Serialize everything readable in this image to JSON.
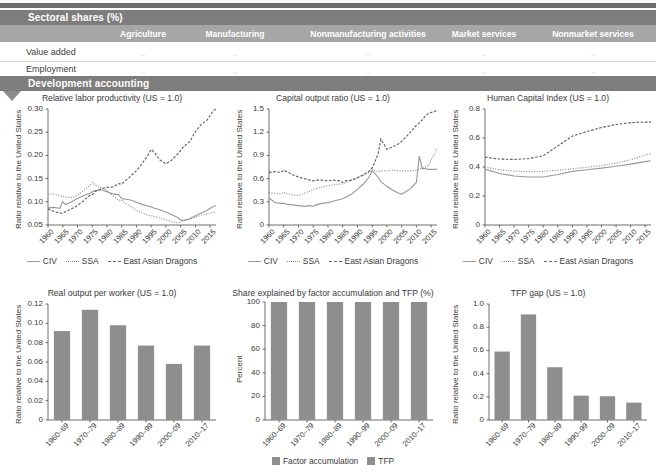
{
  "sectoral_panel": {
    "title": "Sectoral shares (%)",
    "columns": [
      "Agriculture",
      "Manufacturing",
      "Nonmanufacturing activities",
      "Market services",
      "Nonmarket services"
    ],
    "rows": [
      {
        "label": "Value added",
        "values": [
          "..",
          "..",
          "..",
          "..",
          ".."
        ]
      },
      {
        "label": "Employment",
        "values": [
          "..",
          "..",
          "..",
          "..",
          ".."
        ]
      }
    ]
  },
  "development_panel": {
    "title": "Development accounting"
  },
  "colors": {
    "band": "#7d7d7d",
    "column_header": "#a6a6a6",
    "bar": "#8e8e8e",
    "civ": "#9a9a9a",
    "ssa": "#8a8a8a",
    "dragons": "#5f5f5f"
  },
  "legends": {
    "lines": [
      "CIV",
      "SSA",
      "East Asian Dragons"
    ],
    "bars": [
      "Factor accumulation",
      "TFP"
    ]
  },
  "chart_data": [
    {
      "id": "relative-labor-productivity",
      "type": "line",
      "title": "Relative labor productivity (US = 1.0)",
      "ylabel": "Ratio relative to the United States",
      "xlabel": "",
      "ylim": [
        0.05,
        0.3
      ],
      "yticks": [
        "0.05",
        "0.10",
        "0.15",
        "0.20",
        "0.25",
        "0.30"
      ],
      "xlim": [
        1960,
        2017
      ],
      "xticks": [
        "1960",
        "1965",
        "1970",
        "1975",
        "1980",
        "1985",
        "1990",
        "1995",
        "2000",
        "2005",
        "2010",
        "2015"
      ],
      "grid": false,
      "legend_position": "bottom",
      "x": [
        1960,
        1962,
        1964,
        1965,
        1966,
        1968,
        1970,
        1972,
        1974,
        1975,
        1976,
        1978,
        1980,
        1982,
        1984,
        1985,
        1986,
        1988,
        1990,
        1992,
        1994,
        1995,
        1996,
        1998,
        2000,
        2002,
        2004,
        2005,
        2006,
        2008,
        2010,
        2012,
        2014,
        2016,
        2017
      ],
      "series": [
        {
          "name": "CIV",
          "style": "solid",
          "values": [
            0.087,
            0.088,
            0.086,
            0.1,
            0.094,
            0.1,
            0.107,
            0.113,
            0.118,
            0.121,
            0.124,
            0.126,
            0.122,
            0.117,
            0.115,
            0.107,
            0.106,
            0.104,
            0.099,
            0.094,
            0.091,
            0.089,
            0.086,
            0.083,
            0.078,
            0.072,
            0.066,
            0.061,
            0.06,
            0.063,
            0.07,
            0.076,
            0.082,
            0.09,
            0.092
          ]
        },
        {
          "name": "SSA",
          "style": "dotted",
          "values": [
            0.116,
            0.117,
            0.113,
            0.112,
            0.11,
            0.109,
            0.114,
            0.124,
            0.134,
            0.142,
            0.136,
            0.131,
            0.125,
            0.113,
            0.103,
            0.104,
            0.098,
            0.09,
            0.082,
            0.076,
            0.071,
            0.07,
            0.068,
            0.065,
            0.061,
            0.057,
            0.055,
            0.056,
            0.059,
            0.063,
            0.067,
            0.071,
            0.074,
            0.077,
            0.078
          ]
        },
        {
          "name": "East Asian Dragons",
          "style": "dashed",
          "values": [
            0.085,
            0.079,
            0.076,
            0.075,
            0.079,
            0.085,
            0.092,
            0.102,
            0.113,
            0.115,
            0.122,
            0.128,
            0.131,
            0.132,
            0.139,
            0.138,
            0.144,
            0.155,
            0.167,
            0.183,
            0.201,
            0.213,
            0.207,
            0.19,
            0.182,
            0.19,
            0.203,
            0.21,
            0.219,
            0.229,
            0.251,
            0.267,
            0.276,
            0.296,
            0.3
          ]
        }
      ]
    },
    {
      "id": "capital-output-ratio",
      "type": "line",
      "title": "Capital output ratio (US = 1.0)",
      "ylabel": "Ratio relative to the United States",
      "xlabel": "",
      "ylim": [
        0,
        1.5
      ],
      "yticks": [
        "0",
        "0.3",
        "0.6",
        "0.9",
        "1.2",
        "1.5"
      ],
      "xlim": [
        1960,
        2017
      ],
      "xticks": [
        "1960",
        "1965",
        "1970",
        "1975",
        "1980",
        "1985",
        "1990",
        "1995",
        "2000",
        "2005",
        "2010",
        "2015"
      ],
      "grid": false,
      "legend_position": "bottom",
      "x": [
        1960,
        1962,
        1964,
        1965,
        1966,
        1968,
        1970,
        1972,
        1974,
        1975,
        1976,
        1978,
        1980,
        1982,
        1984,
        1985,
        1986,
        1988,
        1990,
        1992,
        1994,
        1995,
        1996,
        1997,
        1998,
        2000,
        2002,
        2004,
        2005,
        2006,
        2008,
        2010,
        2011,
        2012,
        2013,
        2014,
        2016,
        2017
      ],
      "series": [
        {
          "name": "CIV",
          "style": "solid",
          "values": [
            0.35,
            0.29,
            0.28,
            0.28,
            0.27,
            0.26,
            0.25,
            0.24,
            0.25,
            0.24,
            0.26,
            0.28,
            0.29,
            0.31,
            0.33,
            0.34,
            0.36,
            0.4,
            0.46,
            0.53,
            0.62,
            0.7,
            0.66,
            0.62,
            0.56,
            0.5,
            0.45,
            0.41,
            0.4,
            0.42,
            0.47,
            0.55,
            0.89,
            0.73,
            0.73,
            0.72,
            0.72,
            0.72
          ]
        },
        {
          "name": "SSA",
          "style": "dotted",
          "values": [
            0.42,
            0.41,
            0.4,
            0.42,
            0.41,
            0.39,
            0.38,
            0.41,
            0.44,
            0.46,
            0.47,
            0.49,
            0.51,
            0.52,
            0.53,
            0.53,
            0.55,
            0.58,
            0.61,
            0.64,
            0.68,
            0.72,
            0.7,
            0.69,
            0.7,
            0.7,
            0.71,
            0.7,
            0.7,
            0.7,
            0.7,
            0.71,
            0.72,
            0.73,
            0.75,
            0.77,
            0.91,
            1.0
          ]
        },
        {
          "name": "East Asian Dragons",
          "style": "dashed",
          "values": [
            0.68,
            0.69,
            0.68,
            0.71,
            0.69,
            0.65,
            0.62,
            0.6,
            0.58,
            0.57,
            0.58,
            0.58,
            0.57,
            0.58,
            0.57,
            0.55,
            0.57,
            0.58,
            0.61,
            0.65,
            0.7,
            0.74,
            0.82,
            0.92,
            1.11,
            0.98,
            1.01,
            1.05,
            1.08,
            1.12,
            1.2,
            1.29,
            1.32,
            1.36,
            1.41,
            1.44,
            1.47,
            1.48
          ]
        }
      ]
    },
    {
      "id": "human-capital-index",
      "type": "line",
      "title": "Human Capital Index (US = 1.0)",
      "ylabel": "Ratio relative to the United States",
      "xlabel": "",
      "ylim": [
        0,
        0.8
      ],
      "yticks": [
        "0",
        "0.2",
        "0.4",
        "0.6",
        "0.8"
      ],
      "xlim": [
        1960,
        2017
      ],
      "xticks": [
        "1960",
        "1965",
        "1970",
        "1975",
        "1980",
        "1985",
        "1990",
        "1995",
        "2000",
        "2005",
        "2010",
        "2015"
      ],
      "grid": false,
      "legend_position": "bottom",
      "x": [
        1960,
        1965,
        1970,
        1975,
        1980,
        1985,
        1990,
        1995,
        2000,
        2005,
        2010,
        2015,
        2017
      ],
      "series": [
        {
          "name": "CIV",
          "style": "solid",
          "values": [
            0.385,
            0.355,
            0.338,
            0.331,
            0.331,
            0.348,
            0.37,
            0.381,
            0.392,
            0.405,
            0.42,
            0.437,
            0.443
          ]
        },
        {
          "name": "SSA",
          "style": "dotted",
          "values": [
            0.4,
            0.381,
            0.371,
            0.368,
            0.37,
            0.378,
            0.388,
            0.398,
            0.41,
            0.428,
            0.45,
            0.483,
            0.492
          ]
        },
        {
          "name": "East Asian Dragons",
          "style": "dashed",
          "values": [
            0.468,
            0.455,
            0.452,
            0.458,
            0.478,
            0.545,
            0.613,
            0.645,
            0.672,
            0.693,
            0.706,
            0.71,
            0.71
          ]
        }
      ]
    },
    {
      "id": "real-output-per-worker",
      "type": "bar",
      "title": "Real output per worker (US = 1.0)",
      "ylabel": "Ratio relative to the United States",
      "xlabel": "",
      "ylim": [
        0,
        0.12
      ],
      "yticks": [
        "0",
        "0.02",
        "0.04",
        "0.06",
        "0.08",
        "0.10",
        "0.12"
      ],
      "categories": [
        "1960–69",
        "1970–79",
        "1980–89",
        "1990–99",
        "2000–09",
        "2010–17"
      ],
      "values": [
        0.092,
        0.114,
        0.098,
        0.077,
        0.058,
        0.077
      ],
      "grid": false
    },
    {
      "id": "share-factor-accumulation-tfp",
      "type": "bar",
      "title": "Share explained by factor accumulation and TFP (%)",
      "ylabel": "Percent",
      "xlabel": "",
      "ylim": [
        0,
        100
      ],
      "yticks": [
        "0",
        "20",
        "40",
        "60",
        "80",
        "100"
      ],
      "categories": [
        "1960–69",
        "1970–79",
        "1980–89",
        "1990–99",
        "2000–09",
        "2010–17"
      ],
      "series": [
        {
          "name": "Factor accumulation",
          "values": [
            100,
            100,
            100,
            100,
            100,
            100
          ]
        },
        {
          "name": "TFP",
          "values": [
            0,
            0,
            0,
            0,
            0,
            0
          ]
        }
      ],
      "stacked": true,
      "grid": false,
      "legend_position": "bottom"
    },
    {
      "id": "tfp-gap",
      "type": "bar",
      "title": "TFP gap (US = 1.0)",
      "ylabel": "Ratio relative to the United States",
      "xlabel": "",
      "ylim": [
        0,
        1.0
      ],
      "yticks": [
        "0",
        "0.2",
        "0.4",
        "0.6",
        "0.8",
        "1.0"
      ],
      "categories": [
        "1960–69",
        "1970–79",
        "1980–89",
        "1990–99",
        "2000–09",
        "2010–17"
      ],
      "values": [
        0.59,
        0.91,
        0.455,
        0.21,
        0.205,
        0.15
      ],
      "grid": false
    }
  ]
}
